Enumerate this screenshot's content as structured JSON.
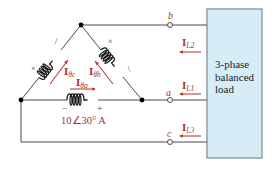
{
  "diagram": {
    "type": "delta-connected 3-phase generator feeding balanced load",
    "terminals": [
      {
        "id": "b",
        "label": "b"
      },
      {
        "id": "a",
        "label": "a"
      },
      {
        "id": "c",
        "label": "c"
      }
    ],
    "phase_currents": [
      {
        "id": "theta_c",
        "main": "I",
        "sub": "θc"
      },
      {
        "id": "theta_b",
        "main": "I",
        "sub": "θb"
      },
      {
        "id": "theta_a",
        "main": "I",
        "sub": "θa"
      }
    ],
    "line_currents": [
      {
        "id": "L2",
        "main": "I",
        "sub": "L2"
      },
      {
        "id": "L1",
        "main": "I",
        "sub": "L1"
      },
      {
        "id": "L3",
        "main": "I",
        "sub": "L3"
      }
    ],
    "source_value": "10∠30° A",
    "polarity": {
      "minus": "−",
      "plus": "+"
    },
    "dot_marks": {
      "x": "×",
      "tick": "\\"
    },
    "load_box": {
      "line1": "3-phase",
      "line2": "balanced",
      "line3": "load",
      "fill": "#d6edf7",
      "border": "#7a8a90"
    },
    "colors": {
      "label_red": "#a3352c",
      "wire": "#4a4a4a"
    }
  }
}
